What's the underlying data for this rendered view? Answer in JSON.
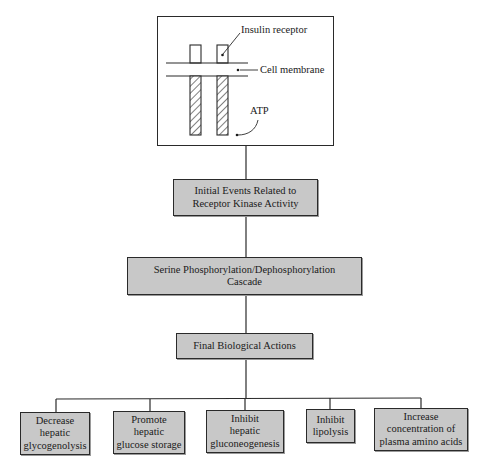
{
  "receptor_panel": {
    "labels": {
      "insulin_receptor": "Insulin receptor",
      "cell_membrane": "Cell membrane",
      "atp": "ATP"
    }
  },
  "flow": {
    "step1": {
      "line1": "Initial Events Related to",
      "line2": "Receptor Kinase Activity"
    },
    "step2": {
      "line1": "Serine Phosphorylation/Dephosphorylation",
      "line2": "Cascade"
    },
    "step3": {
      "line1": "Final Biological Actions"
    }
  },
  "actions": [
    {
      "lines": [
        "Decrease",
        "hepatic",
        "glycogenolysis"
      ]
    },
    {
      "lines": [
        "Promote",
        "hepatic",
        "glucose storage"
      ]
    },
    {
      "lines": [
        "Inhibit",
        "hepatic",
        "gluconeogenesis"
      ]
    },
    {
      "lines": [
        "Inhibit",
        "lipolysis"
      ]
    },
    {
      "lines": [
        "Increase",
        "concentration of",
        "plasma amino acids"
      ]
    }
  ],
  "colors": {
    "box_fill": "#c8c8c8",
    "line": "#2a2a2a",
    "background": "#ffffff"
  }
}
